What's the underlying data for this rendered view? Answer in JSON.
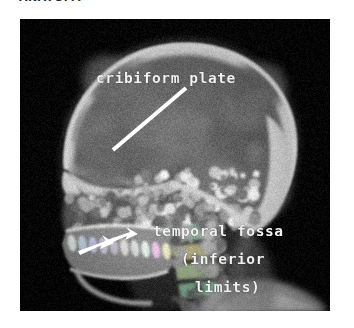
{
  "page": {
    "top_caption_remnant": "ANATOMY",
    "background_color": "#ffffff"
  },
  "figure": {
    "name": "sagittal-skull-ct",
    "modality": "CT",
    "view": "lateral sagittal",
    "frame_background": "#070707",
    "frame": {
      "x": 20,
      "y": 19,
      "width": 310,
      "height": 292
    }
  },
  "annotations": {
    "colors": {
      "text": "#f2f2f2",
      "pointer_line": "#ffffff",
      "arrow_marker": "#ffffff"
    },
    "labels": [
      {
        "id": "cribiform-plate",
        "text": "cribiform plate",
        "x": 76,
        "y": 52
      },
      {
        "id": "temporal-fossa",
        "text": "temporal fossa",
        "x": 133,
        "y": 205
      },
      {
        "id": "inferior",
        "text": "(inferior",
        "x": 161,
        "y": 233
      },
      {
        "id": "limits",
        "text": "limits)",
        "x": 175,
        "y": 261
      }
    ],
    "pointer_line": {
      "id": "cribiform-plate-pointer",
      "from_x": 166,
      "from_y": 69,
      "to_x": 93,
      "to_y": 131,
      "width": 4
    },
    "arrow_markers": [
      {
        "id": "mandible-arrow-left",
        "x": 72,
        "y": 222,
        "angle": -20
      },
      {
        "id": "mandible-arrow-right",
        "x": 96,
        "y": 214,
        "angle": -20
      }
    ]
  }
}
